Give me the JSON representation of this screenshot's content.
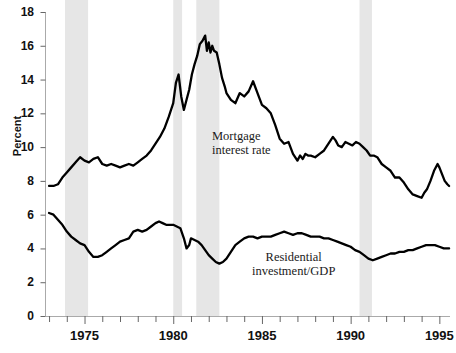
{
  "chart_data": {
    "type": "line",
    "title": "",
    "xlabel": "",
    "ylabel": "Percent",
    "xlim": [
      1972.8,
      1995.6
    ],
    "ylim": [
      0,
      18
    ],
    "grid": false,
    "legend_position": "inline-annotations",
    "y_ticks": [
      0,
      2,
      4,
      6,
      8,
      10,
      12,
      14,
      16,
      18
    ],
    "y_tick_labels": [
      "0",
      "2",
      "4",
      "6",
      "8",
      "10",
      "12",
      "14",
      "16",
      "18"
    ],
    "x_ticks": [
      1975,
      1980,
      1985,
      1990,
      1995
    ],
    "x_tick_labels": [
      "1975",
      "1980",
      "1985",
      "1990",
      "1995"
    ],
    "x_minor_tick_step": 1,
    "shaded_regions": [
      {
        "name": "recession-1973-1975",
        "start": 1973.9,
        "end": 1975.2
      },
      {
        "name": "recession-1980",
        "start": 1980.0,
        "end": 1980.5
      },
      {
        "name": "recession-1981-1982",
        "start": 1981.3,
        "end": 1982.6
      },
      {
        "name": "recession-1990-1991",
        "start": 1990.5,
        "end": 1991.2
      }
    ],
    "shading_color": "#e6e6e6",
    "line_color": "#000000",
    "series": [
      {
        "name": "Mortgage interest rate",
        "label": "Mortgage\ninterest rate",
        "color": "#000000",
        "points": [
          [
            1973.0,
            7.7
          ],
          [
            1973.25,
            7.7
          ],
          [
            1973.5,
            7.8
          ],
          [
            1973.75,
            8.2
          ],
          [
            1974.0,
            8.5
          ],
          [
            1974.25,
            8.8
          ],
          [
            1974.5,
            9.1
          ],
          [
            1974.75,
            9.4
          ],
          [
            1975.0,
            9.2
          ],
          [
            1975.25,
            9.1
          ],
          [
            1975.5,
            9.3
          ],
          [
            1975.75,
            9.4
          ],
          [
            1976.0,
            9.0
          ],
          [
            1976.25,
            8.9
          ],
          [
            1976.5,
            9.0
          ],
          [
            1976.75,
            8.9
          ],
          [
            1977.0,
            8.8
          ],
          [
            1977.25,
            8.9
          ],
          [
            1977.5,
            9.0
          ],
          [
            1977.75,
            8.9
          ],
          [
            1978.0,
            9.1
          ],
          [
            1978.25,
            9.3
          ],
          [
            1978.5,
            9.5
          ],
          [
            1978.75,
            9.8
          ],
          [
            1979.0,
            10.2
          ],
          [
            1979.25,
            10.6
          ],
          [
            1979.5,
            11.1
          ],
          [
            1979.75,
            11.8
          ],
          [
            1980.0,
            12.6
          ],
          [
            1980.15,
            13.8
          ],
          [
            1980.3,
            14.3
          ],
          [
            1980.45,
            13.0
          ],
          [
            1980.6,
            12.2
          ],
          [
            1980.75,
            12.8
          ],
          [
            1980.9,
            13.4
          ],
          [
            1981.05,
            14.3
          ],
          [
            1981.2,
            14.9
          ],
          [
            1981.35,
            15.4
          ],
          [
            1981.5,
            16.1
          ],
          [
            1981.65,
            16.3
          ],
          [
            1981.8,
            16.6
          ],
          [
            1981.9,
            15.7
          ],
          [
            1982.0,
            16.2
          ],
          [
            1982.1,
            15.6
          ],
          [
            1982.2,
            16.0
          ],
          [
            1982.3,
            15.7
          ],
          [
            1982.45,
            15.6
          ],
          [
            1982.6,
            14.9
          ],
          [
            1982.75,
            14.1
          ],
          [
            1982.9,
            13.6
          ],
          [
            1983.0,
            13.2
          ],
          [
            1983.25,
            12.8
          ],
          [
            1983.5,
            12.6
          ],
          [
            1983.75,
            13.2
          ],
          [
            1984.0,
            13.0
          ],
          [
            1984.25,
            13.3
          ],
          [
            1984.5,
            13.9
          ],
          [
            1984.75,
            13.2
          ],
          [
            1985.0,
            12.5
          ],
          [
            1985.25,
            12.3
          ],
          [
            1985.5,
            12.0
          ],
          [
            1985.75,
            11.3
          ],
          [
            1986.0,
            10.5
          ],
          [
            1986.25,
            10.2
          ],
          [
            1986.5,
            10.3
          ],
          [
            1986.75,
            9.6
          ],
          [
            1987.0,
            9.2
          ],
          [
            1987.15,
            9.5
          ],
          [
            1987.3,
            9.3
          ],
          [
            1987.45,
            9.6
          ],
          [
            1987.6,
            9.5
          ],
          [
            1987.75,
            9.5
          ],
          [
            1988.0,
            9.4
          ],
          [
            1988.25,
            9.6
          ],
          [
            1988.5,
            9.8
          ],
          [
            1988.75,
            10.2
          ],
          [
            1989.0,
            10.6
          ],
          [
            1989.15,
            10.4
          ],
          [
            1989.3,
            10.1
          ],
          [
            1989.5,
            10.0
          ],
          [
            1989.7,
            10.3
          ],
          [
            1989.9,
            10.2
          ],
          [
            1990.1,
            10.1
          ],
          [
            1990.3,
            10.3
          ],
          [
            1990.5,
            10.2
          ],
          [
            1990.7,
            10.0
          ],
          [
            1990.9,
            9.8
          ],
          [
            1991.1,
            9.5
          ],
          [
            1991.3,
            9.5
          ],
          [
            1991.5,
            9.4
          ],
          [
            1991.75,
            9.0
          ],
          [
            1992.0,
            8.8
          ],
          [
            1992.25,
            8.6
          ],
          [
            1992.5,
            8.2
          ],
          [
            1992.75,
            8.2
          ],
          [
            1993.0,
            7.9
          ],
          [
            1993.25,
            7.5
          ],
          [
            1993.5,
            7.2
          ],
          [
            1993.75,
            7.1
          ],
          [
            1994.0,
            7.0
          ],
          [
            1994.15,
            7.3
          ],
          [
            1994.3,
            7.5
          ],
          [
            1994.5,
            8.0
          ],
          [
            1994.7,
            8.6
          ],
          [
            1994.9,
            9.0
          ],
          [
            1995.0,
            8.8
          ],
          [
            1995.15,
            8.4
          ],
          [
            1995.3,
            8.0
          ],
          [
            1995.45,
            7.8
          ],
          [
            1995.55,
            7.7
          ]
        ]
      },
      {
        "name": "Residential investment/GDP",
        "label": "Residential\ninvestment/GDP",
        "color": "#000000",
        "points": [
          [
            1973.0,
            6.1
          ],
          [
            1973.25,
            6.0
          ],
          [
            1973.5,
            5.7
          ],
          [
            1973.75,
            5.4
          ],
          [
            1974.0,
            5.0
          ],
          [
            1974.25,
            4.7
          ],
          [
            1974.5,
            4.5
          ],
          [
            1974.75,
            4.3
          ],
          [
            1975.0,
            4.2
          ],
          [
            1975.25,
            3.8
          ],
          [
            1975.5,
            3.5
          ],
          [
            1975.75,
            3.5
          ],
          [
            1976.0,
            3.6
          ],
          [
            1976.25,
            3.8
          ],
          [
            1976.5,
            4.0
          ],
          [
            1976.75,
            4.2
          ],
          [
            1977.0,
            4.4
          ],
          [
            1977.25,
            4.5
          ],
          [
            1977.5,
            4.6
          ],
          [
            1977.75,
            5.0
          ],
          [
            1978.0,
            5.1
          ],
          [
            1978.25,
            5.0
          ],
          [
            1978.5,
            5.1
          ],
          [
            1978.75,
            5.3
          ],
          [
            1979.0,
            5.5
          ],
          [
            1979.2,
            5.6
          ],
          [
            1979.4,
            5.5
          ],
          [
            1979.6,
            5.4
          ],
          [
            1979.8,
            5.4
          ],
          [
            1980.0,
            5.4
          ],
          [
            1980.2,
            5.3
          ],
          [
            1980.4,
            5.2
          ],
          [
            1980.6,
            4.6
          ],
          [
            1980.75,
            4.0
          ],
          [
            1980.9,
            4.2
          ],
          [
            1981.0,
            4.6
          ],
          [
            1981.2,
            4.5
          ],
          [
            1981.4,
            4.4
          ],
          [
            1981.6,
            4.2
          ],
          [
            1981.8,
            3.9
          ],
          [
            1982.0,
            3.6
          ],
          [
            1982.2,
            3.4
          ],
          [
            1982.4,
            3.2
          ],
          [
            1982.6,
            3.1
          ],
          [
            1982.8,
            3.2
          ],
          [
            1983.0,
            3.4
          ],
          [
            1983.25,
            3.8
          ],
          [
            1983.5,
            4.2
          ],
          [
            1983.75,
            4.4
          ],
          [
            1984.0,
            4.6
          ],
          [
            1984.25,
            4.7
          ],
          [
            1984.5,
            4.7
          ],
          [
            1984.75,
            4.6
          ],
          [
            1985.0,
            4.7
          ],
          [
            1985.25,
            4.7
          ],
          [
            1985.5,
            4.7
          ],
          [
            1985.75,
            4.8
          ],
          [
            1986.0,
            4.9
          ],
          [
            1986.25,
            5.0
          ],
          [
            1986.5,
            4.9
          ],
          [
            1986.75,
            4.8
          ],
          [
            1987.0,
            4.9
          ],
          [
            1987.25,
            4.9
          ],
          [
            1987.5,
            4.8
          ],
          [
            1987.75,
            4.7
          ],
          [
            1988.0,
            4.7
          ],
          [
            1988.25,
            4.7
          ],
          [
            1988.5,
            4.6
          ],
          [
            1988.75,
            4.6
          ],
          [
            1989.0,
            4.5
          ],
          [
            1989.25,
            4.4
          ],
          [
            1989.5,
            4.3
          ],
          [
            1989.75,
            4.2
          ],
          [
            1990.0,
            4.1
          ],
          [
            1990.25,
            3.9
          ],
          [
            1990.5,
            3.8
          ],
          [
            1990.75,
            3.6
          ],
          [
            1991.0,
            3.4
          ],
          [
            1991.25,
            3.3
          ],
          [
            1991.5,
            3.4
          ],
          [
            1991.75,
            3.5
          ],
          [
            1992.0,
            3.6
          ],
          [
            1992.25,
            3.7
          ],
          [
            1992.5,
            3.7
          ],
          [
            1992.75,
            3.8
          ],
          [
            1993.0,
            3.8
          ],
          [
            1993.25,
            3.9
          ],
          [
            1993.5,
            3.9
          ],
          [
            1993.75,
            4.0
          ],
          [
            1994.0,
            4.1
          ],
          [
            1994.25,
            4.2
          ],
          [
            1994.5,
            4.2
          ],
          [
            1994.75,
            4.2
          ],
          [
            1995.0,
            4.1
          ],
          [
            1995.25,
            4.0
          ],
          [
            1995.55,
            4.0
          ]
        ]
      }
    ]
  },
  "axis": {
    "ylabel": "Percent"
  },
  "annotations": {
    "mortgage": "Mortgage\ninterest rate",
    "residential": "Residential\ninvestment/GDP"
  }
}
